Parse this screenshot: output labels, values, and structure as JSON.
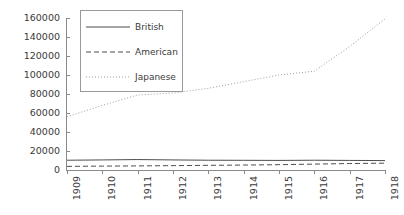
{
  "chart_data": {
    "type": "line",
    "title": "",
    "subtitle": "",
    "xlabel": "",
    "ylabel": "",
    "x": [
      1909,
      1910,
      1911,
      1912,
      1913,
      1914,
      1915,
      1916,
      1917,
      1918
    ],
    "xtick_labels": [
      "1909",
      "1910",
      "1911",
      "1912",
      "1913",
      "1914",
      "1915",
      "1916",
      "1917",
      "1918"
    ],
    "ytick_labels": [
      "0",
      "20000",
      "40000",
      "60000",
      "80000",
      "100000",
      "120000",
      "140000",
      "160000"
    ],
    "ytick_values": [
      0,
      20000,
      40000,
      60000,
      80000,
      100000,
      120000,
      140000,
      160000
    ],
    "ylim": [
      0,
      160000
    ],
    "xlim": [
      1909,
      1918
    ],
    "grid": false,
    "legend_position": "top-left",
    "series": [
      {
        "name": "British",
        "style": "solid",
        "color": "#4d4d4d",
        "values": [
          10300,
          10600,
          11000,
          10600,
          10300,
          10200,
          10100,
          10300,
          10100,
          9900
        ]
      },
      {
        "name": "American",
        "style": "dashed",
        "color": "#4d4d4d",
        "values": [
          3800,
          4100,
          4300,
          4600,
          4900,
          5200,
          5600,
          6200,
          6800,
          7200
        ]
      },
      {
        "name": "Japanese",
        "style": "dotted",
        "color": "#9e9e9e",
        "values": [
          56000,
          68000,
          79000,
          81000,
          86000,
          93000,
          100000,
          104000,
          130000,
          159000
        ]
      }
    ]
  },
  "legend": {
    "entries": [
      {
        "label": "British"
      },
      {
        "label": "American"
      },
      {
        "label": "Japanese"
      }
    ]
  },
  "colors": {
    "axis": "#8a8a8a",
    "text": "#3a3a3a",
    "background": "#ffffff",
    "legend_border": "#9a9a9a"
  }
}
